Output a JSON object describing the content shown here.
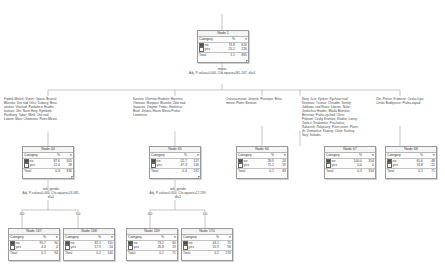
{
  "diagram": {
    "type": "chaid-decision-tree",
    "column_headers": [
      "Category",
      "%",
      "n"
    ],
    "legend": {
      "no_label": "no",
      "yes_label": "yes",
      "total_label": "Total",
      "no_color": "#4f4f4f",
      "yes_color": "#ffffff"
    }
  },
  "nodes": {
    "root": {
      "title": "Node 1",
      "rows": [
        {
          "cat": "no",
          "pct": "74.8",
          "n": "620"
        },
        {
          "cat": "yes",
          "pct": "25.2",
          "n": "226"
        }
      ],
      "total": {
        "label": "Total",
        "pct": "1.1",
        "n": "885"
      }
    },
    "n44": {
      "title": "Node 44",
      "rows": [
        {
          "cat": "no",
          "pct": "87.6",
          "n": "305"
        },
        {
          "cat": "yes",
          "pct": "12.4",
          "n": "28"
        }
      ],
      "total": {
        "label": "Total",
        "pct": "0.3",
        "n": "336"
      }
    },
    "n65": {
      "title": "Node 65",
      "rows": [
        {
          "cat": "no",
          "pct": "52.7",
          "n": "127"
        },
        {
          "cat": "yes",
          "pct": "47.3",
          "n": "116"
        }
      ],
      "total": {
        "label": "Total",
        "pct": "0.3",
        "n": "241"
      }
    },
    "n66": {
      "title": "Node 66",
      "rows": [
        {
          "cat": "no",
          "pct": "28.9",
          "n": "24"
        },
        {
          "cat": "yes",
          "pct": "71.1",
          "n": "59"
        }
      ],
      "total": {
        "label": "Total",
        "pct": "0.1",
        "n": "83"
      }
    },
    "n67": {
      "title": "Node 67",
      "rows": [
        {
          "cat": "no",
          "pct": "100.0",
          "n": "354"
        },
        {
          "cat": "yes",
          "pct": "0.0",
          "n": "0"
        }
      ],
      "total": {
        "label": "Total",
        "pct": "0.3",
        "n": "354"
      }
    },
    "n68": {
      "title": "Node 68",
      "rows": [
        {
          "cat": "no",
          "pct": "65.6",
          "n": "48"
        },
        {
          "cat": "yes",
          "pct": "31.8",
          "n": "22"
        }
      ],
      "total": {
        "label": "Total",
        "pct": "0.1",
        "n": "71"
      }
    },
    "n167": {
      "title": "Node 167",
      "rows": [
        {
          "cat": "no",
          "pct": "95.7",
          "n": "90"
        },
        {
          "cat": "yes",
          "pct": "4.3",
          "n": "4"
        }
      ],
      "total": {
        "label": "Total",
        "pct": "0.1",
        "n": "94"
      }
    },
    "n168": {
      "title": "Node 168",
      "rows": [
        {
          "cat": "no",
          "pct": "82.1",
          "n": "110"
        },
        {
          "cat": "yes",
          "pct": "17.9",
          "n": "24"
        }
      ],
      "total": {
        "label": "Total",
        "pct": "0.2",
        "n": "140"
      }
    },
    "n169": {
      "title": "Node 169",
      "rows": [
        {
          "cat": "no",
          "pct": "73.2",
          "n": "60"
        },
        {
          "cat": "yes",
          "pct": "26.8",
          "n": "19"
        }
      ],
      "total": {
        "label": "Total",
        "pct": "0.1",
        "n": "71"
      }
    },
    "n170": {
      "title": "Node 170",
      "rows": [
        {
          "cat": "no",
          "pct": "44.1",
          "n": "75"
        },
        {
          "cat": "yes",
          "pct": "55.9",
          "n": "96"
        }
      ],
      "total": {
        "label": "Total",
        "pct": "0.2",
        "n": "170"
      }
    }
  },
  "splits": {
    "root_split": "mesto\nAdj. P-value=0.000, Chi-square=361.167, df=4",
    "split_left": "vek_gender\nAdj. P-value=0.000, Chi-square=13.085,\ndf=1",
    "split_mid": "vek_gender\nAdj. P-value=0.000, Chi-square=17.299,\ndf=1"
  },
  "branch_labels": {
    "b1": "Frydek-Mistek; Vsetin; Opava; Bruntal;\nBlansko; Usti nad Orlici; Dubovy; Brno-\nvenkov; Vlachod; Pardubice; Hradec\nkralove; Jilin; Nove Hory; Rymbork;\nPardhovy; Tabor; Mlnik; Usti nad\nLabem; Most; Chomutov; Plzen-Mesto",
    "b2": "Karvina; Uherske Hradiste; Hornitriz;\nOlomouc; Burjaani; Blansko; Zdar nad\nSazavou; Znojmo; Trebic; Havlickuv\nBrod; Jihlava; Hlavni Mesto Praha;\nLitomerice",
    "b3": "Ostrava-mesto; Jesenik; Prostejov; Brno-\nmesto; Plzen; Benicov",
    "b4": "Novy Jicin; Vyskov; Rychnov nad\nKneznou; Trutnov; Chrudim; Semily;\nJablonec nad Nisou; Liberec; Nalin;\nJindrichuv Hradec; Mlada Boleslav;\nBenesov; Praha-vychod; Okrin;\nPribram; Cesky Krumlov; Kladno; Louny;\nTeplice; Strakonice; Prachatice;\nRakovnik; Rokycany; Plzen-sever; Plzen-\njih; Domazlice; Klatovy; Cheb; Karlovy\nVary; Sokolov",
    "b5": "Zlin; Prerov; Kromeriz; Ceska Lipa;\nCeske Budejovice; Praha-zapad",
    "left_0": "0.0",
    "left_1": "1.0",
    "mid_0": "0.0",
    "mid_1": "1.0"
  }
}
